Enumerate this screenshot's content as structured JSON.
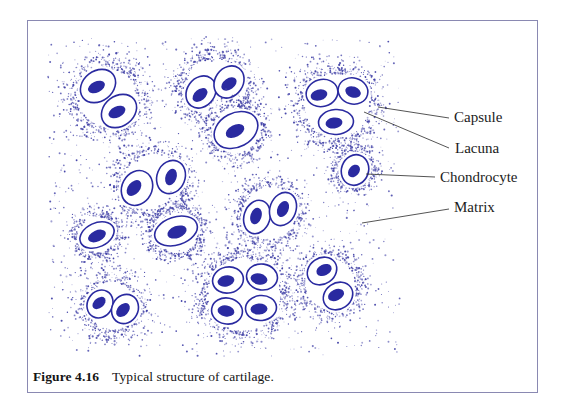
{
  "figure_caption": {
    "number": "Figure 4.16",
    "text": "Typical structure of cartilage."
  },
  "annotation_labels": [
    {
      "text": "Capsule",
      "tx": 454,
      "ty": 122,
      "line": {
        "x1": 378,
        "y1": 107,
        "x2": 449,
        "y2": 118
      }
    },
    {
      "text": "Lacuna",
      "tx": 455,
      "ty": 153,
      "line": {
        "x1": 364,
        "y1": 112,
        "x2": 449,
        "y2": 148
      }
    },
    {
      "text": "Chondrocyte",
      "tx": 440,
      "ty": 182,
      "line": {
        "x1": 366,
        "y1": 174,
        "x2": 435,
        "y2": 177
      }
    },
    {
      "text": "Matrix",
      "tx": 454,
      "ty": 212,
      "line": {
        "x1": 362,
        "y1": 223,
        "x2": 449,
        "y2": 209
      }
    }
  ],
  "colors": {
    "ink": "#2a2aa0",
    "dot": "#4343a8",
    "border": "#8a89b2",
    "label_text": "#1c1c1c",
    "leader": "#2a2a2a",
    "background": "#ffffff"
  },
  "matrix_region": {
    "x": 48,
    "y": 38,
    "w": 352,
    "h": 318
  },
  "clusters": [
    {
      "name": "cluster-pair-top-left",
      "halo": {
        "cx": 108,
        "cy": 98,
        "r": 31,
        "fade": 14
      },
      "cells": [
        {
          "cx": 98,
          "cy": 86,
          "rx": 19,
          "ry": 15,
          "rot": -38,
          "nucleus": {
            "cx": 96.5,
            "cy": 87,
            "rx": 9,
            "ry": 5.5,
            "rot": -25
          }
        },
        {
          "cx": 119,
          "cy": 111,
          "rx": 19,
          "ry": 15,
          "rot": -38,
          "nucleus": {
            "cx": 117,
            "cy": 112,
            "rx": 9,
            "ry": 5.5,
            "rot": -25
          }
        }
      ]
    },
    {
      "name": "cluster-pair-top-middle",
      "halo": {
        "cx": 215,
        "cy": 88,
        "r": 31,
        "fade": 12
      },
      "cells": [
        {
          "cx": 201,
          "cy": 92,
          "rx": 17,
          "ry": 14,
          "rot": -55,
          "nucleus": {
            "cx": 200,
            "cy": 95,
            "rx": 8.5,
            "ry": 5.5,
            "rot": -40
          }
        },
        {
          "cx": 229,
          "cy": 82,
          "rx": 17,
          "ry": 14,
          "rot": -55,
          "nucleus": {
            "cx": 229,
            "cy": 84,
            "rx": 8.5,
            "ry": 5.5,
            "rot": -35
          }
        }
      ]
    },
    {
      "name": "cluster-single-top-middle",
      "halo": {
        "cx": 236,
        "cy": 130,
        "r": 25,
        "fade": 10
      },
      "cells": [
        {
          "cx": 236,
          "cy": 130,
          "rx": 23,
          "ry": 17,
          "rot": -28,
          "nucleus": {
            "cx": 235,
            "cy": 131,
            "rx": 10,
            "ry": 6,
            "rot": -28
          }
        }
      ]
    },
    {
      "name": "cluster-trio-top-right",
      "halo": {
        "cx": 337,
        "cy": 106,
        "r": 34,
        "fade": 13
      },
      "cells": [
        {
          "cx": 322,
          "cy": 93,
          "rx": 16,
          "ry": 13.5,
          "rot": -15,
          "nucleus": {
            "cx": 319,
            "cy": 95,
            "rx": 8.5,
            "ry": 5.5,
            "rot": -15
          }
        },
        {
          "cx": 353,
          "cy": 91,
          "rx": 15,
          "ry": 13,
          "rot": 15,
          "nucleus": {
            "cx": 353,
            "cy": 92,
            "rx": 8,
            "ry": 5.5,
            "rot": 20
          }
        },
        {
          "cx": 336,
          "cy": 122,
          "rx": 17.5,
          "ry": 12.5,
          "rot": -4,
          "nucleus": {
            "cx": 334,
            "cy": 123,
            "rx": 8.5,
            "ry": 5.5,
            "rot": -8
          }
        }
      ]
    },
    {
      "name": "cluster-single-chondrocyte",
      "halo": {
        "cx": 355,
        "cy": 170,
        "r": 18,
        "fade": 8
      },
      "cells": [
        {
          "cx": 355,
          "cy": 170,
          "rx": 13.5,
          "ry": 15.5,
          "rot": 20,
          "nucleus": {
            "cx": 354,
            "cy": 171,
            "rx": 7,
            "ry": 5.2,
            "rot": -50
          }
        }
      ]
    },
    {
      "name": "cluster-pair-middle-left",
      "halo": {
        "cx": 153,
        "cy": 183,
        "r": 31,
        "fade": 12
      },
      "cells": [
        {
          "cx": 137,
          "cy": 188,
          "rx": 18,
          "ry": 15,
          "rot": -62,
          "nucleus": {
            "cx": 134,
            "cy": 188,
            "rx": 9,
            "ry": 6,
            "rot": -50
          }
        },
        {
          "cx": 171,
          "cy": 177,
          "rx": 17,
          "ry": 14,
          "rot": -68,
          "nucleus": {
            "cx": 171,
            "cy": 177,
            "rx": 8.5,
            "ry": 5.5,
            "rot": -70
          }
        }
      ]
    },
    {
      "name": "cluster-pair-middle-right",
      "halo": {
        "cx": 270,
        "cy": 213,
        "r": 28,
        "fade": 11
      },
      "cells": [
        {
          "cx": 257,
          "cy": 217,
          "rx": 17,
          "ry": 13,
          "rot": -72,
          "nucleus": {
            "cx": 256,
            "cy": 216,
            "rx": 8.5,
            "ry": 5.5,
            "rot": -72
          }
        },
        {
          "cx": 283,
          "cy": 209,
          "rx": 17,
          "ry": 13,
          "rot": -70,
          "nucleus": {
            "cx": 283,
            "cy": 209,
            "rx": 8.5,
            "ry": 5.5,
            "rot": -66
          }
        }
      ]
    },
    {
      "name": "cluster-single-middle",
      "halo": {
        "cx": 176,
        "cy": 231,
        "r": 24,
        "fade": 9
      },
      "cells": [
        {
          "cx": 176,
          "cy": 231,
          "rx": 22,
          "ry": 14,
          "rot": -18,
          "nucleus": {
            "cx": 177,
            "cy": 232,
            "rx": 10,
            "ry": 6,
            "rot": -20
          }
        }
      ]
    },
    {
      "name": "cluster-single-left-small",
      "halo": {
        "cx": 97,
        "cy": 235,
        "r": 20,
        "fade": 9
      },
      "cells": [
        {
          "cx": 97,
          "cy": 235,
          "rx": 18,
          "ry": 12,
          "rot": -25,
          "nucleus": {
            "cx": 97,
            "cy": 236,
            "rx": 9.5,
            "ry": 5.5,
            "rot": -25
          }
        }
      ]
    },
    {
      "name": "cluster-quad-bottom-middle",
      "halo": {
        "cx": 244,
        "cy": 295,
        "r": 38,
        "fade": 13
      },
      "cells": [
        {
          "cx": 228,
          "cy": 280,
          "rx": 15.5,
          "ry": 13,
          "rot": -12,
          "nucleus": {
            "cx": 226,
            "cy": 281,
            "rx": 8.5,
            "ry": 5.5,
            "rot": -12
          }
        },
        {
          "cx": 262,
          "cy": 277,
          "rx": 15.5,
          "ry": 13,
          "rot": 8,
          "nucleus": {
            "cx": 259,
            "cy": 279,
            "rx": 8.5,
            "ry": 5.5,
            "rot": 12
          }
        },
        {
          "cx": 227,
          "cy": 311,
          "rx": 15.5,
          "ry": 13,
          "rot": 10,
          "nucleus": {
            "cx": 226,
            "cy": 311,
            "rx": 8.5,
            "ry": 5.5,
            "rot": 10
          }
        },
        {
          "cx": 261,
          "cy": 308,
          "rx": 15.5,
          "ry": 12.5,
          "rot": -6,
          "nucleus": {
            "cx": 259,
            "cy": 309,
            "rx": 8.5,
            "ry": 5.5,
            "rot": -4
          }
        }
      ]
    },
    {
      "name": "cluster-pair-bottom-right",
      "halo": {
        "cx": 330,
        "cy": 284,
        "r": 27,
        "fade": 11
      },
      "cells": [
        {
          "cx": 322,
          "cy": 271,
          "rx": 15.5,
          "ry": 13,
          "rot": -35,
          "nucleus": {
            "cx": 324,
            "cy": 270,
            "rx": 8,
            "ry": 5.5,
            "rot": -25
          }
        },
        {
          "cx": 338,
          "cy": 296,
          "rx": 15.5,
          "ry": 13,
          "rot": -35,
          "nucleus": {
            "cx": 336,
            "cy": 295,
            "rx": 8.5,
            "ry": 5.5,
            "rot": -25
          }
        }
      ]
    },
    {
      "name": "cluster-pair-bottom-left",
      "halo": {
        "cx": 112,
        "cy": 306,
        "r": 26,
        "fade": 11
      },
      "cells": [
        {
          "cx": 100,
          "cy": 304,
          "rx": 14.5,
          "ry": 12.5,
          "rot": -60,
          "nucleus": {
            "cx": 99,
            "cy": 303,
            "rx": 7.5,
            "ry": 5,
            "rot": -40
          }
        },
        {
          "cx": 125,
          "cy": 309,
          "rx": 15,
          "ry": 13,
          "rot": -62,
          "nucleus": {
            "cx": 123,
            "cy": 310,
            "rx": 8,
            "ry": 5.5,
            "rot": -45
          }
        }
      ]
    }
  ]
}
